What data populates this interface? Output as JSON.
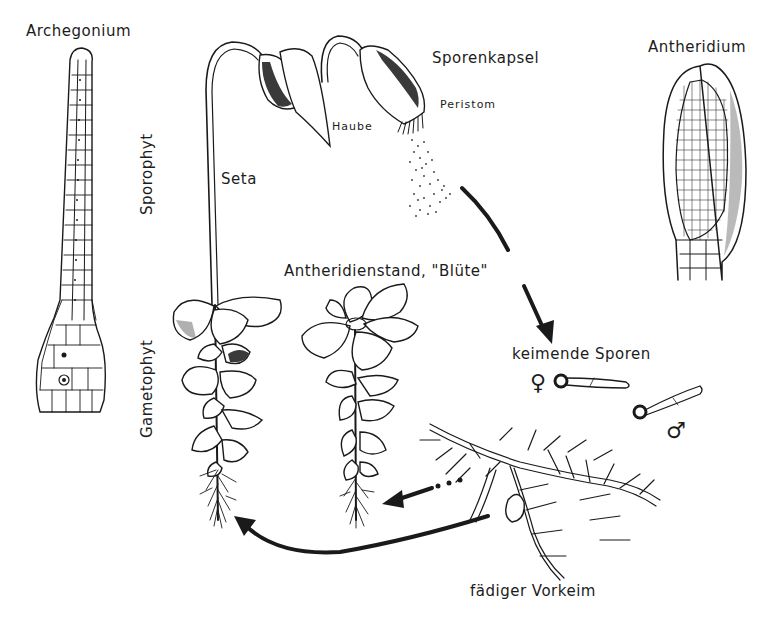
{
  "diagram": {
    "labels": {
      "archegonium": "Archegonium",
      "sporenkapsel": "Sporenkapsel",
      "peristom": "Peristom",
      "haube": "Haube",
      "antheridium": "Antheridium",
      "sporophyt": "Sporophyt",
      "gametophyt": "Gametophyt",
      "seta": "Seta",
      "antheridienstand": "Antheridienstand, \"Blüte\"",
      "keimende_sporen": "keimende Sporen",
      "female_symbol": "♀",
      "male_symbol": "♂",
      "vorkeim": "fädiger Vorkeim"
    },
    "arrows": [
      {
        "from": "Sporenkapsel",
        "to": "keimende Sporen",
        "style": "solid"
      },
      {
        "from": "fädiger Vorkeim",
        "to": "Antheridienstand",
        "style": "dotted-then-solid"
      },
      {
        "from": "fädiger Vorkeim",
        "to": "Gametophyt",
        "style": "curved-solid"
      }
    ],
    "colors": {
      "ink": "#1a1a1a",
      "background": "#ffffff"
    }
  }
}
